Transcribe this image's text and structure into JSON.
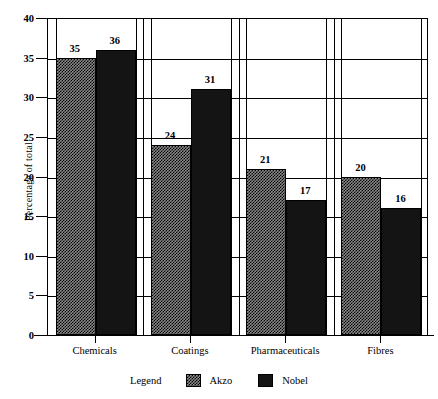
{
  "chart_data": {
    "type": "bar",
    "title": "",
    "subtitle": "",
    "xlabel": "",
    "ylabel": "Percentage of total",
    "ylim": [
      0,
      40
    ],
    "ytick_step": 5,
    "yticks": [
      0,
      5,
      10,
      15,
      20,
      25,
      30,
      35,
      40
    ],
    "ytick_labels": [
      "0",
      "5",
      "10",
      "15",
      "20",
      "25",
      "30",
      "35",
      "40"
    ],
    "grid": true,
    "grid_axis": "both",
    "legend_position": "bottom-center",
    "legend_title": "Legend",
    "categories": [
      "Chemicals",
      "Coatings",
      "Pharmaceuticals",
      "Fibres"
    ],
    "series": [
      {
        "name": "Akzo",
        "color": "#8a8a8a",
        "pattern": "checker-dither",
        "values": [
          35,
          24,
          21,
          20
        ],
        "value_labels": [
          "35",
          "24",
          "21",
          "20"
        ]
      },
      {
        "name": "Nobel",
        "color": "#141414",
        "pattern": "solid",
        "values": [
          36,
          31,
          17,
          16
        ],
        "value_labels": [
          "36",
          "31",
          "17",
          "16"
        ]
      }
    ]
  },
  "colors": {
    "background": "#ffffff",
    "axis": "#000000",
    "grid": "#000000",
    "akzo": "#8a8a8a",
    "nobel": "#141414"
  }
}
